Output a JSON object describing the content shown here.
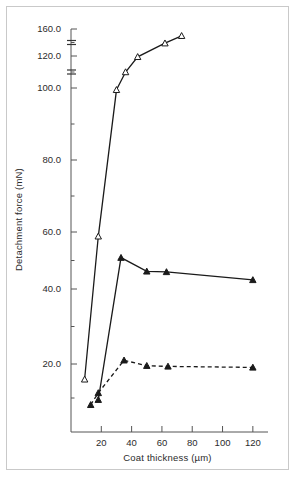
{
  "figure": {
    "name": "detachment-force-vs-coat-thickness",
    "frame_color": "#c9c9c9",
    "background": "#ffffff",
    "ink_color": "#1a1a1a"
  },
  "chart_data": {
    "type": "line",
    "title": "",
    "xlabel": "Coat thickness (µm)",
    "ylabel": "Detachment force (mN)",
    "xlim": [
      0,
      130
    ],
    "ylim": [
      0,
      165
    ],
    "grid": false,
    "legend": "none",
    "axis_breaks": [
      {
        "axis": "y",
        "between": [
          100.0,
          120.0
        ]
      },
      {
        "axis": "y",
        "between": [
          120.0,
          160.0
        ]
      }
    ],
    "xticks": [
      20,
      40,
      60,
      80,
      100,
      120
    ],
    "xtick_labels": [
      "20",
      "40",
      "60",
      "80",
      "100",
      "120"
    ],
    "yticks": [
      20.0,
      40.0,
      60.0,
      80.0,
      100.0,
      120.0,
      160.0
    ],
    "ytick_labels": [
      "20.0",
      "40.0",
      "60.0",
      "80.0",
      "100.0",
      "120.0",
      "160.0"
    ],
    "yminorticks": [
      10.0,
      30.0,
      50.0,
      70.0,
      90.0,
      110.0,
      140.0
    ],
    "series": [
      {
        "name": "open-triangle-series",
        "marker": "triangle-open",
        "linestyle": "solid",
        "color": "#1a1a1a",
        "x": [
          9,
          18,
          30,
          36,
          44,
          62,
          73
        ],
        "y": [
          15.5,
          58.5,
          99.5,
          110.0,
          119.5,
          139.0,
          150.0
        ]
      },
      {
        "name": "filled-triangle-solid-series",
        "marker": "triangle-filled",
        "linestyle": "solid",
        "color": "#1a1a1a",
        "x": [
          18,
          33,
          50,
          63,
          120
        ],
        "y": [
          9.5,
          51.0,
          46.2,
          46.0,
          43.2
        ]
      },
      {
        "name": "filled-triangle-dashed-series",
        "marker": "triangle-filled",
        "linestyle": "dashed",
        "color": "#1a1a1a",
        "x": [
          13,
          18,
          35,
          50,
          64,
          120
        ],
        "y": [
          8.0,
          11.5,
          21.0,
          19.5,
          19.3,
          19.0
        ]
      }
    ]
  }
}
